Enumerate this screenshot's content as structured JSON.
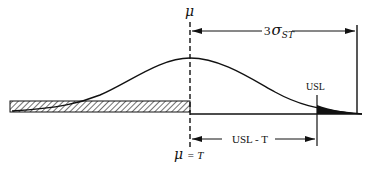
{
  "diagram": {
    "type": "process-capability-normal-curve",
    "labels": {
      "mu_top": "μ",
      "three_sigma_coef": "3",
      "three_sigma_symbol": "σ",
      "three_sigma_subscript": "ST",
      "usl": "USL",
      "usl_minus_t": "USL - T",
      "mu_bottom": "μ",
      "mu_bottom_eq": "= T"
    },
    "colors": {
      "ink": "#111111",
      "background": "#ffffff"
    }
  }
}
